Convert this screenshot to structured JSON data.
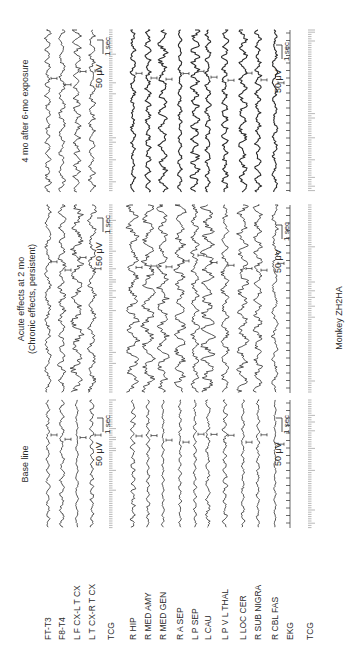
{
  "figure": {
    "caption": "Monkey ZH2HA",
    "channels": [
      {
        "label": "FT-T3",
        "type": "eeg",
        "x": 48
      },
      {
        "label": "F8-T4",
        "type": "eeg",
        "x": 62
      },
      {
        "label": "L F CX-L T CX",
        "type": "eeg",
        "x": 77
      },
      {
        "label": "L T CX-R T CX",
        "type": "eeg",
        "x": 92
      },
      {
        "label": "TCG",
        "type": "tcg",
        "x": 111
      },
      {
        "label": "R HIP",
        "type": "eeg",
        "x": 133
      },
      {
        "label": "R MED AMY",
        "type": "eeg",
        "x": 148
      },
      {
        "label": "R MED GEN",
        "type": "eeg",
        "x": 163
      },
      {
        "label": "R A SEP",
        "type": "eeg",
        "x": 180
      },
      {
        "label": "L P SEP",
        "type": "eeg",
        "x": 195
      },
      {
        "label": "L CAU",
        "type": "eeg",
        "x": 208
      },
      {
        "label": "L P V L THAL",
        "type": "eeg",
        "x": 225
      },
      {
        "label": "L LOC CER",
        "type": "eeg",
        "x": 243
      },
      {
        "label": "R SUB NIGRA",
        "type": "eeg",
        "x": 258
      },
      {
        "label": "R CBL FAS",
        "type": "eeg",
        "x": 275
      },
      {
        "label": "EKG",
        "type": "ekg",
        "x": 290
      },
      {
        "label": "TCG",
        "type": "tcg",
        "x": 310
      }
    ],
    "panels": [
      {
        "title": "Base line",
        "subtitle": "",
        "y_start": 400,
        "y_end": 528,
        "amplitude": 2.2,
        "freq": 0.55,
        "scale_bars": [
          {
            "text": "50 μV",
            "time": "1 sec",
            "x": 103,
            "y": 418
          },
          {
            "text": "50 μV",
            "time": "1 sec",
            "x": 282,
            "y": 418
          }
        ]
      },
      {
        "title": "Acute effects at 2 mo",
        "subtitle": "(Chronic effects, persistent)",
        "y_start": 205,
        "y_end": 393,
        "amplitude": 5.5,
        "freq": 0.32,
        "scale_bars": [
          {
            "text": "50 μV",
            "time": "1 sec",
            "x": 103,
            "y": 218
          },
          {
            "text": "50 μV",
            "time": "1 sec",
            "x": 282,
            "y": 225
          }
        ]
      },
      {
        "title": "4 mo after 6-mo exposure",
        "subtitle": "",
        "y_start": 30,
        "y_end": 192,
        "amplitude": 4.0,
        "freq": 0.45,
        "scale_bars": [
          {
            "text": "50 μV",
            "time": "1 sec",
            "x": 103,
            "y": 40
          },
          {
            "text": "50 μV",
            "time": "1 sec",
            "x": 282,
            "y": 45
          }
        ]
      }
    ],
    "colors": {
      "ink": "#2a2a2a",
      "background": "#ffffff"
    }
  }
}
